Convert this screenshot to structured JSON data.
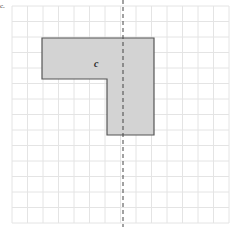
{
  "figure": {
    "part_label": "c.",
    "shape_label": "c",
    "colors": {
      "grid": "#e4e4e4",
      "shape_fill": "#d3d3d3",
      "shape_stroke": "#555555",
      "axis": "#444444"
    },
    "grid": {
      "origin_x": 12,
      "origin_y": 6,
      "step": 15.5,
      "cols": 14,
      "rows": 14
    },
    "shape_polygon": [
      [
        42,
        38
      ],
      [
        154,
        38
      ],
      [
        154,
        135
      ],
      [
        107,
        135
      ],
      [
        107,
        79
      ],
      [
        42,
        79
      ]
    ],
    "symmetry_line": {
      "x": 123,
      "y1": 0,
      "y2": 227,
      "style": "dashed"
    },
    "shape_label_pos": {
      "x": 94,
      "y": 58
    }
  }
}
